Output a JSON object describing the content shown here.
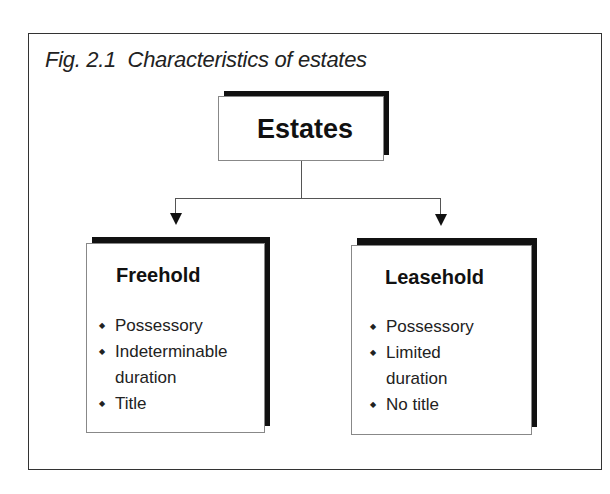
{
  "figure": {
    "title": "Fig. 2.1  Characteristics of estates"
  },
  "root": {
    "label": "Estates"
  },
  "children": [
    {
      "label": "Freehold",
      "bullets": [
        "Possessory",
        "Indeterminable duration",
        "Title"
      ],
      "bullet_lines": [
        "Possessory",
        "Indeterminable",
        "duration",
        "Title"
      ]
    },
    {
      "label": "Leasehold",
      "bullets": [
        "Possessory",
        "Limited duration",
        "No title"
      ],
      "bullet_lines": [
        "Possessory",
        "Limited",
        "duration",
        "No title"
      ]
    }
  ],
  "icons": {
    "bullet": "diamond-bullet-icon",
    "connector_arrow": "arrow-down-icon"
  },
  "colors": {
    "shadow": "#111111",
    "border": "#888888",
    "text": "#1a1a1a"
  }
}
